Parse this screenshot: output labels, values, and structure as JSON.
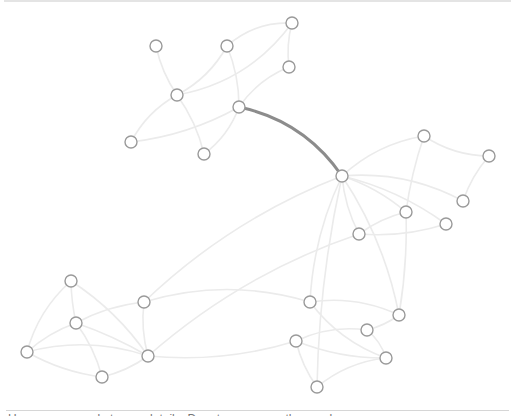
{
  "diagram": {
    "type": "network-graph",
    "node_style": {
      "radius": 6,
      "stroke": "#9a9a9a",
      "fill": "#ffffff"
    },
    "edge_style": {
      "stroke": "#ebebeb",
      "highlight_stroke": "#8c8c8c"
    },
    "nodes": [
      {
        "id": 0,
        "x": 156,
        "y": 46
      },
      {
        "id": 1,
        "x": 227,
        "y": 46
      },
      {
        "id": 2,
        "x": 292,
        "y": 23
      },
      {
        "id": 3,
        "x": 289,
        "y": 67
      },
      {
        "id": 4,
        "x": 177,
        "y": 95
      },
      {
        "id": 5,
        "x": 239,
        "y": 107
      },
      {
        "id": 6,
        "x": 131,
        "y": 142
      },
      {
        "id": 7,
        "x": 204,
        "y": 154
      },
      {
        "id": 8,
        "x": 342,
        "y": 176
      },
      {
        "id": 9,
        "x": 424,
        "y": 136
      },
      {
        "id": 10,
        "x": 489,
        "y": 156
      },
      {
        "id": 11,
        "x": 463,
        "y": 201
      },
      {
        "id": 12,
        "x": 406,
        "y": 212
      },
      {
        "id": 13,
        "x": 446,
        "y": 224
      },
      {
        "id": 14,
        "x": 359,
        "y": 234
      },
      {
        "id": 15,
        "x": 71,
        "y": 281
      },
      {
        "id": 16,
        "x": 76,
        "y": 323
      },
      {
        "id": 17,
        "x": 27,
        "y": 352
      },
      {
        "id": 18,
        "x": 144,
        "y": 302
      },
      {
        "id": 19,
        "x": 148,
        "y": 356
      },
      {
        "id": 20,
        "x": 102,
        "y": 377
      },
      {
        "id": 21,
        "x": 310,
        "y": 302
      },
      {
        "id": 22,
        "x": 399,
        "y": 315
      },
      {
        "id": 23,
        "x": 367,
        "y": 330
      },
      {
        "id": 24,
        "x": 296,
        "y": 341
      },
      {
        "id": 25,
        "x": 386,
        "y": 358
      },
      {
        "id": 26,
        "x": 317,
        "y": 387
      }
    ],
    "edges": [
      {
        "s": 0,
        "t": 4,
        "c": 0.1
      },
      {
        "s": 4,
        "t": 1,
        "c": 0.15
      },
      {
        "s": 4,
        "t": 2,
        "c": 0.2
      },
      {
        "s": 1,
        "t": 2,
        "c": -0.2
      },
      {
        "s": 2,
        "t": 3,
        "c": 0.1
      },
      {
        "s": 1,
        "t": 5,
        "c": -0.1
      },
      {
        "s": 5,
        "t": 3,
        "c": -0.15
      },
      {
        "s": 4,
        "t": 6,
        "c": 0.15
      },
      {
        "s": 4,
        "t": 7,
        "c": -0.1
      },
      {
        "s": 6,
        "t": 5,
        "c": 0.1
      },
      {
        "s": 7,
        "t": 5,
        "c": 0.15
      },
      {
        "s": 5,
        "t": 8,
        "c": -0.2,
        "highlight": true
      },
      {
        "s": 8,
        "t": 9,
        "c": -0.15
      },
      {
        "s": 9,
        "t": 10,
        "c": 0.15
      },
      {
        "s": 10,
        "t": 11,
        "c": 0.1
      },
      {
        "s": 9,
        "t": 12,
        "c": 0.05
      },
      {
        "s": 8,
        "t": 11,
        "c": -0.15
      },
      {
        "s": 8,
        "t": 13,
        "c": -0.1
      },
      {
        "s": 8,
        "t": 12,
        "c": -0.1
      },
      {
        "s": 8,
        "t": 14,
        "c": 0.1
      },
      {
        "s": 8,
        "t": 22,
        "c": -0.1
      },
      {
        "s": 8,
        "t": 21,
        "c": 0.1
      },
      {
        "s": 8,
        "t": 18,
        "c": 0.1
      },
      {
        "s": 8,
        "t": 26,
        "c": 0.05
      },
      {
        "s": 12,
        "t": 14,
        "c": 0.1
      },
      {
        "s": 12,
        "t": 22,
        "c": -0.05
      },
      {
        "s": 14,
        "t": 13,
        "c": 0.1
      },
      {
        "s": 14,
        "t": 19,
        "c": 0.1
      },
      {
        "s": 18,
        "t": 21,
        "c": -0.15
      },
      {
        "s": 18,
        "t": 16,
        "c": 0.1
      },
      {
        "s": 18,
        "t": 19,
        "c": 0.1
      },
      {
        "s": 19,
        "t": 24,
        "c": 0.1
      },
      {
        "s": 15,
        "t": 17,
        "c": 0.15
      },
      {
        "s": 15,
        "t": 16,
        "c": 0.05
      },
      {
        "s": 15,
        "t": 19,
        "c": -0.1
      },
      {
        "s": 16,
        "t": 17,
        "c": 0.1
      },
      {
        "s": 16,
        "t": 19,
        "c": -0.05
      },
      {
        "s": 16,
        "t": 20,
        "c": -0.1
      },
      {
        "s": 17,
        "t": 19,
        "c": -0.15
      },
      {
        "s": 17,
        "t": 20,
        "c": 0.1
      },
      {
        "s": 20,
        "t": 19,
        "c": 0.1
      },
      {
        "s": 21,
        "t": 25,
        "c": 0.15
      },
      {
        "s": 21,
        "t": 22,
        "c": -0.15
      },
      {
        "s": 24,
        "t": 23,
        "c": -0.15
      },
      {
        "s": 24,
        "t": 25,
        "c": 0.1
      },
      {
        "s": 24,
        "t": 26,
        "c": 0.1
      },
      {
        "s": 26,
        "t": 25,
        "c": -0.15
      },
      {
        "s": 23,
        "t": 22,
        "c": 0.1
      },
      {
        "s": 23,
        "t": 25,
        "c": -0.15
      }
    ]
  },
  "footer": {
    "caption": "Hover over a node to see details. Drag to rearrange the graph."
  }
}
